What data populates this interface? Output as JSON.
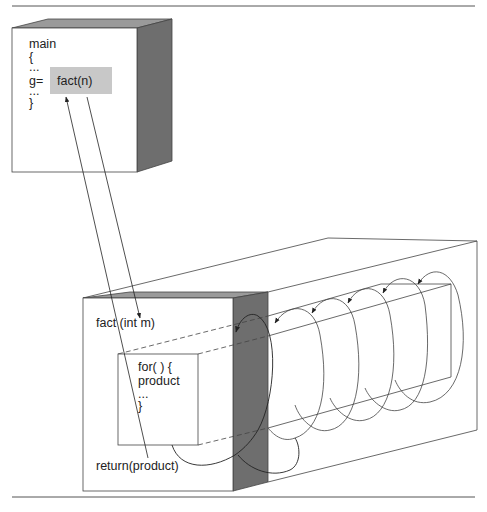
{
  "diagram": {
    "type": "function-call-flow",
    "colors": {
      "line": "#333333",
      "highlight": "#c8c8c8",
      "side_face": "#6e6e6e",
      "top_face": "#9a9a9a",
      "rule": "#555555"
    },
    "main_box": {
      "lines": [
        "main",
        "{",
        "...",
        "g=",
        "...",
        "}"
      ],
      "call_expression": "fact(n)"
    },
    "fact_box": {
      "signature": "fact (int m)",
      "loop_lines": [
        "for( ) {",
        "product",
        "...",
        "}"
      ],
      "return_statement": "return(product)",
      "loop_iterations_shown": 6
    },
    "arrows": [
      {
        "from": "fact(n)",
        "to": "fact (int m)",
        "meaning": "call"
      },
      {
        "from": "return(product)",
        "to": "fact(n)",
        "meaning": "return value"
      }
    ]
  }
}
